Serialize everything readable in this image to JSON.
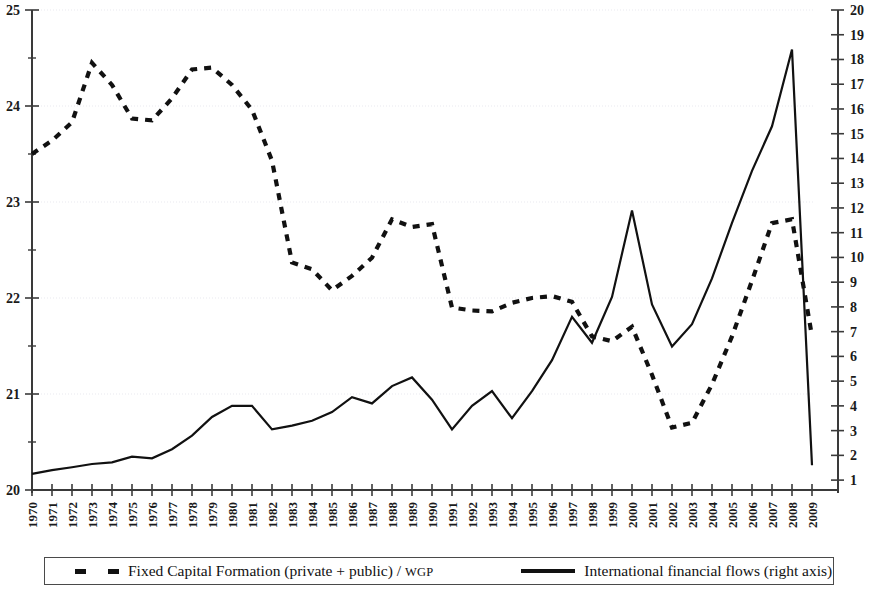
{
  "chart_data": {
    "type": "line",
    "title": "",
    "subtitle": "",
    "xlabel": "",
    "ylabel": "",
    "grid": true,
    "legend_position": "bottom",
    "x": [
      1970,
      1971,
      1972,
      1973,
      1974,
      1975,
      1976,
      1977,
      1978,
      1979,
      1980,
      1981,
      1982,
      1983,
      1984,
      1985,
      1986,
      1987,
      1988,
      1989,
      1990,
      1991,
      1992,
      1993,
      1994,
      1995,
      1996,
      1997,
      1998,
      1999,
      2000,
      2001,
      2002,
      2003,
      2004,
      2005,
      2006,
      2007,
      2008,
      2009
    ],
    "xtick_labels": [
      "1970",
      "1971",
      "1972",
      "1973",
      "1974",
      "1975",
      "1976",
      "1977",
      "1978",
      "1979",
      "1980",
      "1981",
      "1982",
      "1983",
      "1984",
      "1985",
      "1986",
      "1987",
      "1988",
      "1989",
      "1990",
      "1991",
      "1992",
      "1993",
      "1994",
      "1995",
      "1996",
      "1997",
      "1998",
      "1999",
      "2000",
      "2001",
      "2002",
      "2003",
      "2004",
      "2005",
      "2006",
      "2007",
      "2008",
      "2009"
    ],
    "left_axis": {
      "ylim": [
        20,
        25
      ],
      "ticks": [
        20,
        21,
        22,
        23,
        24,
        25
      ],
      "tick_labels": [
        "20",
        "21",
        "22",
        "23",
        "24",
        "25"
      ]
    },
    "right_axis": {
      "ylim": [
        0.6,
        20
      ],
      "ticks": [
        1,
        2,
        3,
        4,
        5,
        6,
        7,
        8,
        9,
        10,
        11,
        12,
        13,
        14,
        15,
        16,
        17,
        18,
        19,
        20
      ],
      "tick_labels": [
        "1",
        "2",
        "3",
        "4",
        "5",
        "6",
        "7",
        "8",
        "9",
        "10",
        "11",
        "12",
        "13",
        "14",
        "15",
        "16",
        "17",
        "18",
        "19",
        "20"
      ]
    },
    "series": [
      {
        "name": "Fixed Capital Formation (private + public) / WGP",
        "axis": "left",
        "style": "dashed",
        "color": "#111111",
        "values": [
          23.5,
          23.64,
          23.83,
          24.45,
          24.22,
          23.87,
          23.85,
          24.08,
          24.38,
          24.4,
          24.22,
          23.96,
          23.43,
          22.37,
          22.3,
          22.08,
          22.23,
          22.42,
          22.82,
          22.74,
          22.77,
          21.9,
          21.87,
          21.86,
          21.95,
          22.0,
          22.02,
          21.96,
          21.6,
          21.55,
          21.7,
          21.2,
          20.65,
          20.7,
          21.1,
          21.6,
          22.18,
          22.78,
          22.82,
          21.6
        ]
      },
      {
        "name": "International financial flows (right axis)",
        "axis": "right",
        "style": "solid",
        "color": "#111111",
        "values": [
          1.25,
          1.4,
          1.52,
          1.65,
          1.72,
          1.95,
          1.88,
          2.25,
          2.8,
          3.55,
          4.0,
          4.0,
          3.05,
          3.2,
          3.4,
          3.75,
          4.35,
          4.1,
          4.8,
          5.15,
          4.25,
          3.05,
          4.0,
          4.6,
          3.5,
          4.6,
          5.85,
          7.6,
          6.55,
          8.4,
          11.9,
          8.1,
          6.4,
          7.3,
          9.15,
          11.4,
          13.5,
          15.3,
          18.4,
          1.6
        ]
      }
    ],
    "legend": [
      {
        "label_main": "Fixed Capital Formation (private + public) / ",
        "label_smallcaps": "WGP",
        "marker": "dashed"
      },
      {
        "label_main": "International financial flows (right axis)",
        "label_smallcaps": "",
        "marker": "solid"
      }
    ]
  },
  "colors": {
    "series": "#111111",
    "grid": "#e9e9ef",
    "axis": "#3a3a3a",
    "background": "#ffffff"
  }
}
